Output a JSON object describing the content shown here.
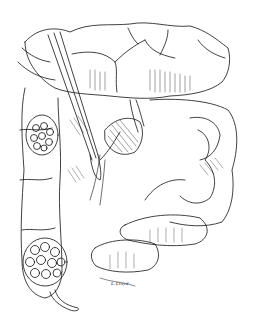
{
  "illustration": {
    "subject": "surgical illustration of abdominal viscera with colon, small bowel loops, mesenteric vessels, and forceps",
    "style": "black ink line drawing with hatching on white",
    "signature": "L.Lloyd",
    "colors": {
      "background": "#ffffff",
      "ink": "#111111"
    }
  }
}
